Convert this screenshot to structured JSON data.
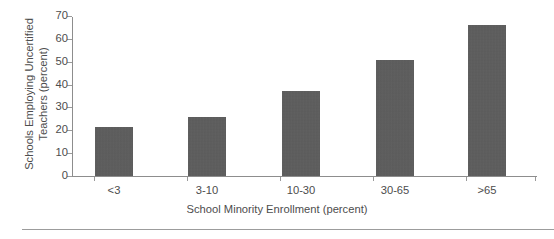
{
  "chart_data": {
    "type": "bar",
    "title": "",
    "subtitle": "",
    "categories": [
      "<3",
      "3-10",
      "10-30",
      "30-65",
      ">65"
    ],
    "values": [
      21.5,
      26,
      37.5,
      51,
      66.5
    ],
    "xlabel": "School Minority Enrollment (percent)",
    "ylabel_line1": "Schools Employing Uncertified",
    "ylabel_line2": "Teachers (percent)",
    "ylabel": "Schools Employing Uncertified Teachers (percent)",
    "ylim": [
      0,
      70
    ],
    "yticks": [
      0,
      10,
      20,
      30,
      40,
      50,
      60,
      70
    ],
    "ytick_labels": [
      "0",
      "10",
      "20",
      "30",
      "40",
      "50",
      "60",
      "70"
    ],
    "grid": false,
    "legend": false,
    "legend_position": "none",
    "bar_color": "#5c5c5c",
    "axis_color": "#8d8d8d",
    "text_color": "#4d4d4d"
  }
}
